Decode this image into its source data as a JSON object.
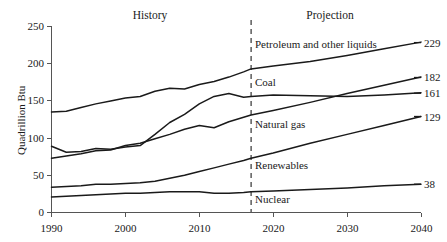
{
  "chart_data": {
    "type": "line",
    "title": "",
    "subtitle": "",
    "xlabel": "",
    "ylabel": "Quadrillion Btu",
    "xlim": [
      1990,
      2040
    ],
    "ylim": [
      0,
      250
    ],
    "xticks": [
      1990,
      2000,
      2010,
      2020,
      2030,
      2040
    ],
    "yticks": [
      0,
      50,
      100,
      150,
      200,
      250
    ],
    "grid": false,
    "legend_position": "inline-labels",
    "annotations": [
      {
        "name": "history",
        "text": "History",
        "x": 1999
      },
      {
        "name": "projection",
        "text": "Projection",
        "x": 2027
      },
      {
        "name": "divider",
        "text": "",
        "x": 2017
      }
    ],
    "divider_x": 2017,
    "series": [
      {
        "name": "Petroleum and other liquids",
        "end_value": "229",
        "x": [
          1990,
          1992,
          1994,
          1996,
          1998,
          2000,
          2002,
          2004,
          2006,
          2008,
          2010,
          2012,
          2014,
          2016,
          2017,
          2020,
          2025,
          2030,
          2035,
          2040
        ],
        "values": [
          135,
          136,
          141,
          146,
          150,
          154,
          156,
          163,
          167,
          166,
          172,
          176,
          182,
          189,
          193,
          197,
          203,
          211,
          220,
          229
        ]
      },
      {
        "name": "Coal",
        "end_value": "161",
        "x": [
          1990,
          1992,
          1994,
          1996,
          1998,
          2000,
          2002,
          2004,
          2006,
          2008,
          2010,
          2012,
          2014,
          2016,
          2017,
          2020,
          2025,
          2030,
          2035,
          2040
        ],
        "values": [
          89,
          81,
          82,
          86,
          85,
          88,
          90,
          105,
          121,
          132,
          146,
          156,
          160,
          155,
          156,
          158,
          157,
          156,
          158,
          161
        ]
      },
      {
        "name": "Natural gas",
        "end_value": "182",
        "x": [
          1990,
          1992,
          1994,
          1996,
          1998,
          2000,
          2002,
          2004,
          2006,
          2008,
          2010,
          2012,
          2014,
          2016,
          2017,
          2020,
          2025,
          2030,
          2035,
          2040
        ],
        "values": [
          73,
          76,
          79,
          83,
          84,
          90,
          93,
          99,
          105,
          112,
          117,
          114,
          122,
          128,
          131,
          137,
          148,
          160,
          171,
          182
        ]
      },
      {
        "name": "Renewables",
        "end_value": "129",
        "x": [
          1990,
          1992,
          1994,
          1996,
          1998,
          2000,
          2002,
          2004,
          2006,
          2008,
          2010,
          2012,
          2014,
          2016,
          2017,
          2020,
          2025,
          2030,
          2035,
          2040
        ],
        "values": [
          34,
          35,
          36,
          38,
          38,
          39,
          40,
          42,
          46,
          50,
          55,
          60,
          65,
          70,
          73,
          80,
          93,
          105,
          117,
          129
        ]
      },
      {
        "name": "Nuclear",
        "end_value": "38",
        "x": [
          1990,
          1992,
          1994,
          1996,
          1998,
          2000,
          2002,
          2004,
          2006,
          2008,
          2010,
          2012,
          2014,
          2016,
          2017,
          2020,
          2025,
          2030,
          2035,
          2040
        ],
        "values": [
          21,
          22,
          23,
          24,
          25,
          26,
          26,
          27,
          28,
          28,
          28,
          26,
          26,
          27,
          28,
          29,
          31,
          33,
          36,
          38
        ]
      }
    ]
  },
  "axes": {
    "y_title": "Quadrillion Btu",
    "y_tick_labels": [
      "250",
      "200",
      "150",
      "100",
      "50",
      "0"
    ],
    "x_tick_labels": [
      "1990",
      "2000",
      "2010",
      "2020",
      "2030",
      "2040"
    ]
  },
  "periods": {
    "history": "History",
    "projection": "Projection"
  },
  "series_labels": {
    "petroleum": "Petroleum and other liquids",
    "coal": "Coal",
    "natural_gas": "Natural gas",
    "renewables": "Renewables",
    "nuclear": "Nuclear"
  },
  "end_values": {
    "petroleum": "229",
    "natural_gas": "182",
    "coal": "161",
    "renewables": "129",
    "nuclear": "38"
  },
  "colors": {
    "line": "#1a1a1a",
    "axis": "#555555",
    "background": "#ffffff"
  }
}
